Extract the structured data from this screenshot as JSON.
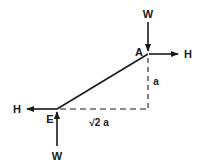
{
  "diagram": {
    "type": "free-body diagram",
    "points": {
      "A": {
        "label": "A"
      },
      "E": {
        "label": "E"
      }
    },
    "forces": {
      "top_weight": {
        "label": "W",
        "direction": "down",
        "at": "A"
      },
      "top_horizontal": {
        "label": "H",
        "direction": "right",
        "at": "A"
      },
      "bottom_weight": {
        "label": "W",
        "direction": "up",
        "at": "E"
      },
      "bottom_horizontal": {
        "label": "H",
        "direction": "left",
        "at": "E"
      }
    },
    "dimensions": {
      "vertical": "a",
      "horizontal": "√2 a"
    },
    "colors": {
      "stroke": "#1a1a1a",
      "background": "#ffffff"
    }
  }
}
